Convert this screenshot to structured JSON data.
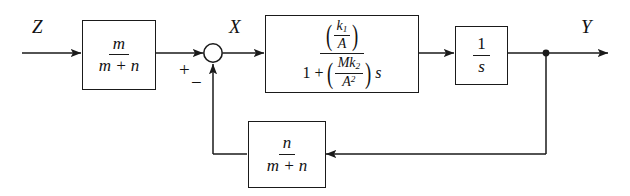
{
  "figure": {
    "kind": "control-system-block-diagram",
    "background_color": "#ffffff",
    "line_color": "#1a1a1a"
  },
  "signals": {
    "input_label": "Z",
    "error_label": "X",
    "output_label": "Y"
  },
  "summing_junction": {
    "plus_sign": "+",
    "minus_sign": "−"
  },
  "blocks": {
    "input_gain": {
      "name": "m-over-m-plus-n",
      "numerator": "m",
      "denominator": "m + n"
    },
    "plant": {
      "name": "first-order-lag",
      "numerator_inner_num": "k",
      "numerator_inner_sub": "1",
      "numerator_inner_den": "A",
      "denominator_lead": "1 +",
      "denominator_inner_num_M": "M",
      "denominator_inner_num_k": "k",
      "denominator_inner_num_sub": "2",
      "denominator_inner_den_A": "A",
      "denominator_inner_den_sup": "2",
      "denominator_tail": "s"
    },
    "integrator": {
      "name": "one-over-s",
      "numerator": "1",
      "denominator": "s"
    },
    "feedback_gain": {
      "name": "n-over-m-plus-n",
      "numerator": "n",
      "denominator": "m + n"
    }
  }
}
